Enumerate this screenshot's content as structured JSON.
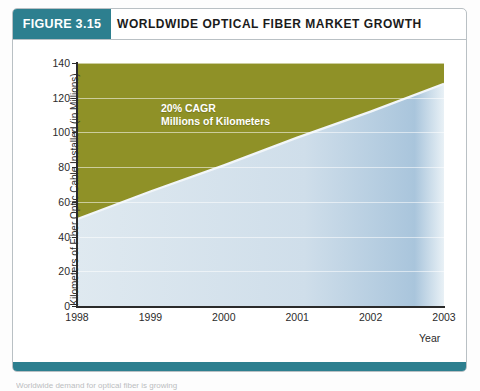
{
  "figure": {
    "badge_label": "FIGURE 3.15",
    "title": "WORLDWIDE OPTICAL FIBER MARKET GROWTH",
    "badge_color": "#2d7f8f",
    "rule_color": "#2d7f8f",
    "caption_sliver": "Worldwide demand for optical fiber is growing"
  },
  "chart_data": {
    "type": "area",
    "title": "WORLDWIDE OPTICAL FIBER MARKET GROWTH",
    "xlabel": "Year",
    "ylabel": "Kilometers of Fiber Optic Cable Installed (in Millions)",
    "categories": [
      "1998",
      "1999",
      "2000",
      "2001",
      "2002",
      "2003"
    ],
    "x": [
      1998,
      1999,
      2000,
      2001,
      2002,
      2003
    ],
    "values": [
      50,
      66,
      81,
      97,
      112,
      128
    ],
    "series": [
      {
        "name": "Kilometers of Fiber Optic Cable Installed",
        "values": [
          50,
          66,
          81,
          97,
          112,
          128
        ]
      }
    ],
    "ylim": [
      0,
      140
    ],
    "yticks": [
      0,
      20,
      40,
      60,
      80,
      100,
      120,
      140
    ],
    "xticks": [
      "1998",
      "1999",
      "2000",
      "2001",
      "2002",
      "2003"
    ],
    "grid": true,
    "legend": "none",
    "annotations": [
      "20% CAGR",
      "Millions of Kilometers"
    ],
    "area_color": "#d7e4ee",
    "background_color": "#8f9127"
  }
}
